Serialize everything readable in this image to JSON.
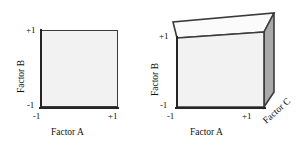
{
  "figure": {
    "caption": "",
    "panels": [
      {
        "id": "two-factor-square",
        "shape": "square",
        "axes": {
          "x": {
            "title": "Factor A",
            "ticks": [
              "-1",
              "+1"
            ]
          },
          "y": {
            "title": "Factor B",
            "ticks": [
              "-1",
              "+1"
            ]
          }
        }
      },
      {
        "id": "three-factor-cube",
        "shape": "cube",
        "axes": {
          "x": {
            "title": "Factor A",
            "ticks": [
              "-1",
              "+1"
            ]
          },
          "y": {
            "title": "Factor B",
            "ticks": [
              "-1",
              "+1"
            ]
          },
          "z": {
            "title": "Factor C",
            "ticks": []
          }
        }
      }
    ]
  },
  "colors": {
    "face_front": "#f2f2f2",
    "face_top": "#fbfbfb",
    "face_right": "#a9a9a9",
    "edge": "#3b3b3b",
    "axis": "#262626",
    "text": "#111111",
    "background": "#ffffff"
  }
}
